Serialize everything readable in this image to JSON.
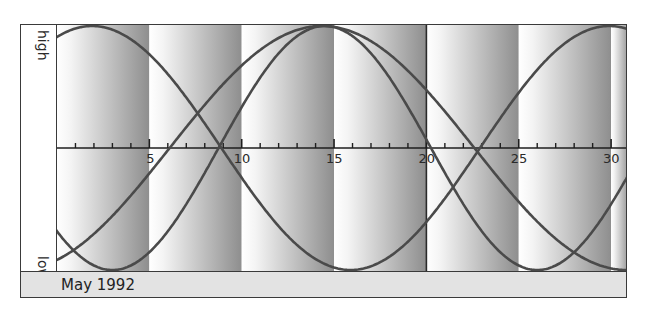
{
  "chart_data": {
    "type": "line",
    "period_label": "May 1992",
    "xlabel": "",
    "ylabel_top": "high",
    "ylabel_bottom": "low",
    "x_ticks": [
      5,
      10,
      15,
      20,
      25,
      30
    ],
    "x_tick_labels": [
      "5",
      "10",
      "15",
      "20",
      "25",
      "30"
    ],
    "xlim": [
      0,
      31
    ],
    "ylim": [
      -1,
      1
    ],
    "grid": false,
    "highlight_day": 20,
    "shaded_bands": [
      [
        0,
        5
      ],
      [
        5,
        10
      ],
      [
        10,
        15
      ],
      [
        15,
        20
      ],
      [
        20,
        25
      ],
      [
        25,
        30
      ],
      [
        30,
        31
      ]
    ],
    "series": [
      {
        "name": "Physical",
        "period_days": 23,
        "upward_zero_day": 8.75,
        "peaks": [
          14.5
        ],
        "troughs": [
          3.0,
          26.0
        ],
        "axis_crossings": [
          8.75,
          20.25
        ]
      },
      {
        "name": "Emotional",
        "period_days": 28,
        "upward_zero_day": -5.1,
        "peaks": [
          1.9,
          29.9
        ],
        "troughs": [
          15.9
        ],
        "axis_crossings": [
          8.9,
          22.9
        ]
      },
      {
        "name": "Intellectual",
        "period_days": 33,
        "upward_zero_day": 6.1,
        "peaks": [
          14.35
        ],
        "troughs": [
          30.85
        ],
        "axis_crossings": [
          6.1,
          22.6
        ]
      }
    ]
  },
  "labels": {
    "high": "high",
    "low": "low",
    "footer": "May 1992"
  },
  "colors": {
    "curve": "#4a4a4a",
    "band_light": "#ffffff",
    "band_dark": "#8c8c8c",
    "footer_bg": "#e3e3e3",
    "frame": "#3a3a3a"
  }
}
